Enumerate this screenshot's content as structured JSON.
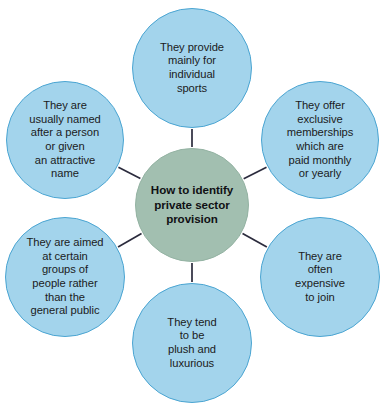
{
  "diagram": {
    "type": "hub-and-spoke",
    "title": "How to identify private sector provision",
    "canvas": {
      "width": 386,
      "height": 417,
      "background": "#ffffff"
    },
    "colors": {
      "hub_fill": "#a2bfb0",
      "hub_border": "#94b3a3",
      "hub_text": "#101014",
      "satellite_fill": "#a3d4ec",
      "satellite_border": "#4ba5d2",
      "satellite_text": "#1b1b22",
      "connector": "#2b2b3d"
    },
    "hub": {
      "label": "How to identify\nprivate sector\nprovision",
      "cx": 192,
      "cy": 205,
      "r": 57
    },
    "satellites": [
      {
        "id": "individual-sports",
        "label": "They provide\nmainly for\nindividual\nsports",
        "cx": 192,
        "cy": 68,
        "r": 60,
        "position": "top"
      },
      {
        "id": "exclusive-memberships",
        "label": "They offer\nexclusive\nmemberships\nwhich are\npaid monthly\nor yearly",
        "cx": 320,
        "cy": 140,
        "r": 59,
        "position": "top-right"
      },
      {
        "id": "expensive-to-join",
        "label": "They are\noften\nexpensive\nto join",
        "cx": 320,
        "cy": 277,
        "r": 60,
        "position": "bottom-right"
      },
      {
        "id": "plush-and-luxurious",
        "label": "They tend\nto be\nplush and\nluxurious",
        "cx": 192,
        "cy": 343,
        "r": 60,
        "position": "bottom"
      },
      {
        "id": "certain-groups",
        "label": "They are aimed\nat certain\ngroups of\npeople rather\nthan the\ngeneral public",
        "cx": 65,
        "cy": 277,
        "r": 60,
        "position": "bottom-left"
      },
      {
        "id": "named-after-person",
        "label": "They are\nusually named\nafter a person\nor given\nan attractive\nname",
        "cx": 65,
        "cy": 140,
        "r": 59,
        "position": "top-left"
      }
    ],
    "connectors": [
      {
        "from": "hub",
        "to": "individual-sports"
      },
      {
        "from": "hub",
        "to": "exclusive-memberships"
      },
      {
        "from": "hub",
        "to": "expensive-to-join"
      },
      {
        "from": "hub",
        "to": "plush-and-luxurious"
      },
      {
        "from": "hub",
        "to": "certain-groups"
      },
      {
        "from": "hub",
        "to": "named-after-person"
      }
    ]
  }
}
